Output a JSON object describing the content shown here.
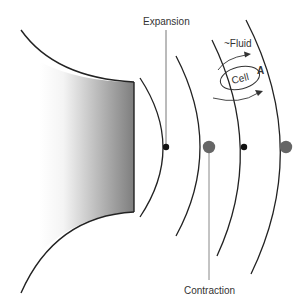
{
  "labels": {
    "expansion": "Expansion",
    "contraction": "Contraction",
    "fluid": "~Fluid",
    "cell": "Cell",
    "a": "A"
  },
  "colors": {
    "line": "#222222",
    "small_dot": "#111111",
    "large_dot": "#666666",
    "leader_line": "#777777",
    "gradient_dark": "#7a7a7a",
    "gradient_light": "#ffffff"
  }
}
